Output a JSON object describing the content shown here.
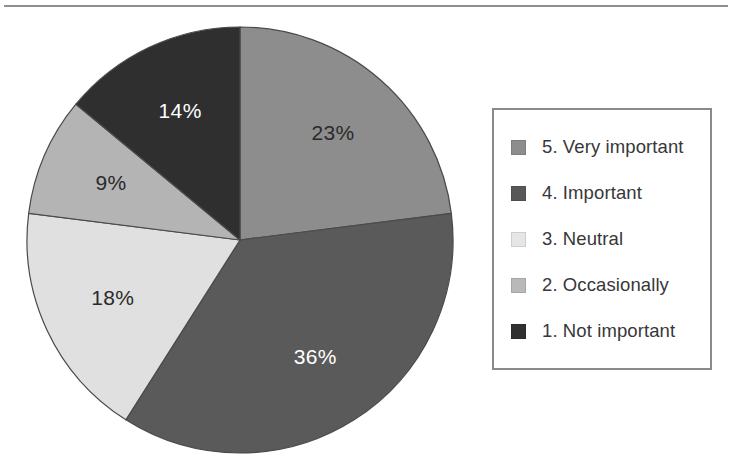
{
  "chart_data": {
    "type": "pie",
    "title": "",
    "categories": [
      "5. Very important",
      "4. Important",
      "3. Neutral",
      "2. Occasionally",
      "1. Not important"
    ],
    "values": [
      23,
      36,
      18,
      9,
      14
    ],
    "value_labels": [
      "23%",
      "36%",
      "18%",
      "9%",
      "14%"
    ],
    "unit": "%",
    "start_angle_deg": 0,
    "direction": "clockwise",
    "legend_position": "right",
    "legend_border": true,
    "grid": false,
    "slice_colors": [
      "#8d8d8d",
      "#5a5a5a",
      "#e0e0e0",
      "#b4b4b4",
      "#2f2f2f"
    ],
    "slice_label_colors": [
      "#2a2a2a",
      "#ffffff",
      "#2a2a2a",
      "#2a2a2a",
      "#ffffff"
    ],
    "slice_edge_color": "#4a4a4a",
    "slices": [
      {
        "label": "5. Very important",
        "value": 23,
        "display": "23%",
        "color": "#8d8d8d",
        "text_color": "#2a2a2a"
      },
      {
        "label": "4. Important",
        "value": 36,
        "display": "36%",
        "color": "#5a5a5a",
        "text_color": "#ffffff"
      },
      {
        "label": "3. Neutral",
        "value": 18,
        "display": "18%",
        "color": "#e0e0e0",
        "text_color": "#2a2a2a"
      },
      {
        "label": "2. Occasionally",
        "value": 9,
        "display": "9%",
        "color": "#b4b4b4",
        "text_color": "#2a2a2a"
      },
      {
        "label": "1. Not important",
        "value": 14,
        "display": "14%",
        "color": "#2f2f2f",
        "text_color": "#ffffff"
      }
    ]
  },
  "legend": {
    "items": [
      {
        "label": "5. Very important",
        "color": "#8d8d8d"
      },
      {
        "label": "4. Important",
        "color": "#585858"
      },
      {
        "label": "3. Neutral",
        "color": "#e6e6e6"
      },
      {
        "label": "2. Occasionally",
        "color": "#b9b9b9"
      },
      {
        "label": "1. Not important",
        "color": "#303030"
      }
    ]
  },
  "geometry": {
    "center_x": 240,
    "center_y": 240,
    "radius": 213,
    "label_radius_ratio": 0.66
  }
}
